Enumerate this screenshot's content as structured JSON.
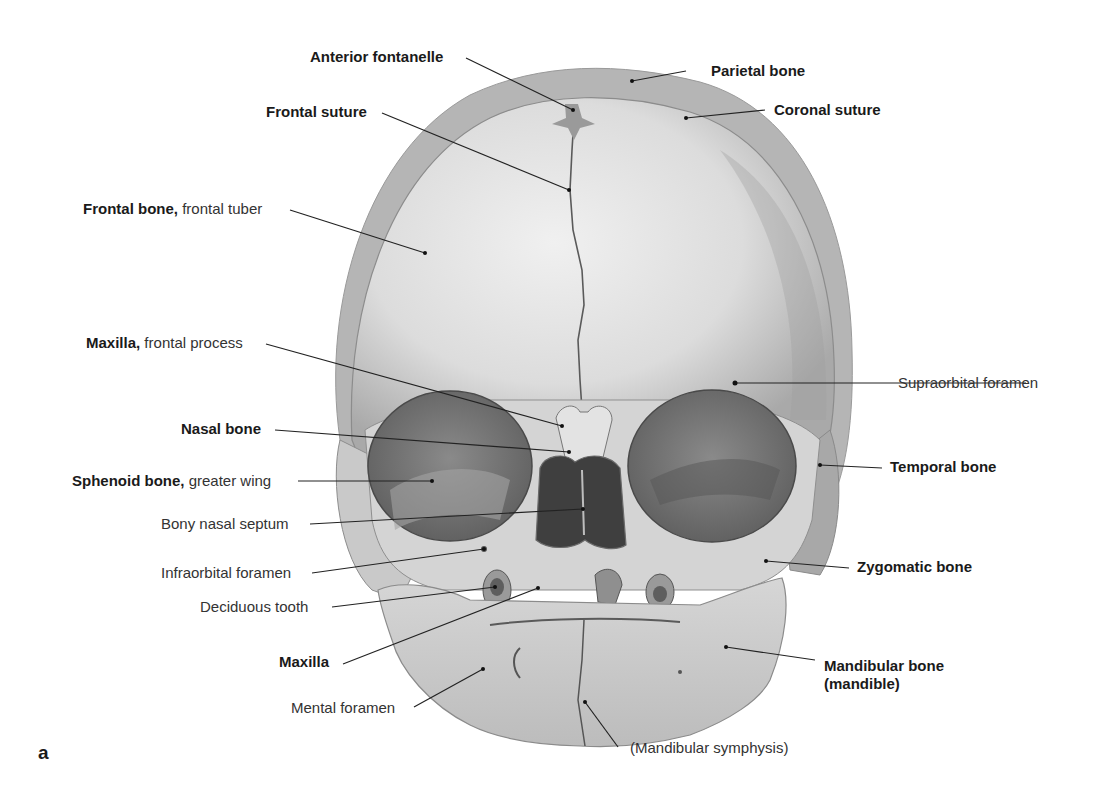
{
  "figure": {
    "panel_letter": "a",
    "colors": {
      "bone_light": "#e6e6e6",
      "bone_mid": "#bdbdbd",
      "bone_dark": "#8e8e8e",
      "cavity": "#6f6f6f",
      "leader": "#222222"
    }
  },
  "labels": {
    "anterior_fontanelle": {
      "bold": "Anterior fontanelle",
      "normal": ""
    },
    "parietal_bone": {
      "bold": "Parietal bone",
      "normal": ""
    },
    "frontal_suture": {
      "bold": "Frontal suture",
      "normal": ""
    },
    "coronal_suture": {
      "bold": "Coronal suture",
      "normal": ""
    },
    "frontal_bone": {
      "bold": "Frontal bone,",
      "normal": " frontal tuber"
    },
    "maxilla_frontal_process": {
      "bold": "Maxilla,",
      "normal": " frontal process"
    },
    "supraorbital_foramen": {
      "bold": "",
      "normal": "Supraorbital foramen"
    },
    "nasal_bone": {
      "bold": "Nasal bone",
      "normal": ""
    },
    "temporal_bone": {
      "bold": "Temporal bone",
      "normal": ""
    },
    "sphenoid_bone": {
      "bold": "Sphenoid bone,",
      "normal": " greater wing"
    },
    "bony_nasal_septum": {
      "bold": "",
      "normal": "Bony nasal septum"
    },
    "infraorbital_foramen": {
      "bold": "",
      "normal": "Infraorbital foramen"
    },
    "zygomatic_bone": {
      "bold": "Zygomatic bone",
      "normal": ""
    },
    "deciduous_tooth": {
      "bold": "",
      "normal": "Deciduous tooth"
    },
    "maxilla": {
      "bold": "Maxilla",
      "normal": ""
    },
    "mandibular_bone_line1": {
      "bold": "Mandibular bone",
      "normal": ""
    },
    "mandibular_bone_line2": {
      "bold": "(mandible)",
      "normal": ""
    },
    "mental_foramen": {
      "bold": "",
      "normal": "Mental foramen"
    },
    "mandibular_symphysis": {
      "bold": "",
      "normal": "(Mandibular symphysis)"
    }
  }
}
